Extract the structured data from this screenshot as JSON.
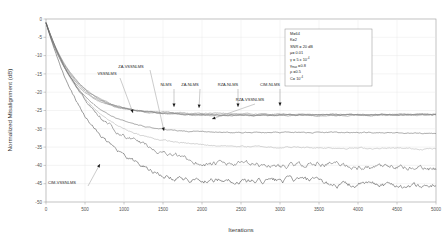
{
  "chart_data": {
    "type": "line",
    "title": "",
    "xlabel": "Iterations",
    "ylabel": "Normalized Misalignment (dB)",
    "xlim": [
      0,
      5000
    ],
    "ylim": [
      -50,
      0
    ],
    "xticks": [
      "0",
      "500",
      "1000",
      "1500",
      "2000",
      "2500",
      "3000",
      "3500",
      "4000",
      "4500",
      "5000"
    ],
    "yticks": [
      "0",
      "-5",
      "-10",
      "-15",
      "-20",
      "-25",
      "-30",
      "-35",
      "-40",
      "-45",
      "-50"
    ],
    "grid": true,
    "legend_position": "inline-annotations",
    "series": [
      {
        "name": "NLMS",
        "steady_state_db": -26.0,
        "knee_iter": 900,
        "color": "#8a8a8a"
      },
      {
        "name": "ZA-NLMS",
        "steady_state_db": -26.2,
        "knee_iter": 950,
        "color": "#909090"
      },
      {
        "name": "RZA-NLMS",
        "steady_state_db": -26.1,
        "knee_iter": 1000,
        "color": "#7d7d7d"
      },
      {
        "name": "CIM-NLMS",
        "steady_state_db": -26.3,
        "knee_iter": 1050,
        "color": "#888888"
      },
      {
        "name": "VSSNLMS",
        "steady_state_db": -31.2,
        "knee_iter": 1200,
        "color": "#6f6f6f"
      },
      {
        "name": "ZA-VSSNLMS",
        "steady_state_db": -35.3,
        "knee_iter": 1400,
        "color": "#b5b5b5"
      },
      {
        "name": "RZA-VSSNLMS",
        "steady_state_db": -40.5,
        "knee_iter": 1700,
        "color": "#5f5f5f"
      },
      {
        "name": "CIM-VSSNLMS",
        "steady_state_db": -45.0,
        "knee_iter": 1500,
        "color": "#4a4a4a"
      }
    ],
    "annotations": [
      {
        "label": "VSSNLMS",
        "text_x": 107,
        "text_y": 75
      },
      {
        "label": "ZA-VSSNLMS",
        "text_x": 131,
        "text_y": 68
      },
      {
        "label": "NLMS",
        "text_x": 166,
        "text_y": 86
      },
      {
        "label": "ZA-NLMS",
        "text_x": 190,
        "text_y": 86
      },
      {
        "label": "RZA-NLMS",
        "text_x": 228,
        "text_y": 86
      },
      {
        "label": "CIM-NLMS",
        "text_x": 270,
        "text_y": 86
      },
      {
        "label": "RZA-VSSNLMS",
        "text_x": 250,
        "text_y": 101
      },
      {
        "label": "CIM-VSSNLMS",
        "text_x": 62,
        "text_y": 184
      }
    ],
    "parameter_box": {
      "lines": [
        {
          "base": "M=64"
        },
        {
          "base": "K=2"
        },
        {
          "base": "SNR = 20 dB"
        },
        {
          "base": "μ= 0.01"
        },
        {
          "base": "γ = 5 x 10",
          "sup": "-4"
        },
        {
          "base": "γ",
          "sub": "max",
          "tail": " =0.8"
        },
        {
          "base": "ρ =0.5"
        },
        {
          "base": "C= 10",
          "sup": "-4"
        }
      ]
    }
  }
}
